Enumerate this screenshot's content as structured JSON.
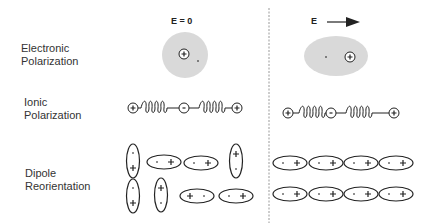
{
  "headers": {
    "no_field": "E = 0",
    "field": "E"
  },
  "rows": [
    {
      "name": "electronic",
      "line1": "Electronic",
      "line2": "Polarization"
    },
    {
      "name": "ionic",
      "line1": "Ionic",
      "line2": "Polarization"
    },
    {
      "name": "dipole",
      "line1": "Dipole",
      "line2": "Reorientation"
    }
  ],
  "symbols": {
    "plus": "+",
    "minus": "-"
  },
  "colors": {
    "cloud": "#d9d9d9",
    "stroke": "#222222",
    "divider": "#999999"
  }
}
